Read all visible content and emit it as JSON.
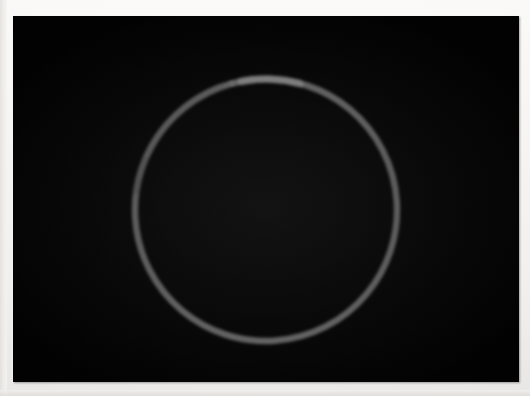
{
  "image": {
    "width": 530,
    "height": 396,
    "background_color": "#f3f1ef",
    "title": "Photograph of a thin gray ring on black background"
  },
  "photo": {
    "name": "ring-photograph",
    "frame": {
      "x": 13,
      "y": 16,
      "width": 506,
      "height": 366
    },
    "background_color": "#000000",
    "subject": "thin gray circular ring / wire loop"
  },
  "chart_data": {
    "type": "scatter",
    "subtitle": "",
    "xlabel": "",
    "ylabel": "",
    "grid": false,
    "legend": "none",
    "xlim": [
      13,
      519
    ],
    "ylim": [
      16,
      382
    ],
    "geometry": {
      "center_x": 266,
      "center_y": 210,
      "radius": 131,
      "stroke_width": 6.5,
      "stroke_color": "#9a9a9a",
      "stroke_color_bright": "#bdbdbd",
      "stroke_color_dim": "#6e6e6e",
      "background_color": "#000000"
    },
    "arc_segments": [
      {
        "name": "main-arc",
        "start_deg": 288,
        "end_deg": 648,
        "brightness": 0.72,
        "width": 6.4
      },
      {
        "name": "bright-top-arc",
        "start_deg": 259,
        "end_deg": 285,
        "brightness": 1.0,
        "width": 7.2
      },
      {
        "name": "upper-left-dash-long",
        "start_deg": 206,
        "end_deg": 250,
        "brightness": 0.66,
        "width": 6.0
      },
      {
        "name": "upper-left-dash-mid",
        "start_deg": 196,
        "end_deg": 203,
        "brightness": 0.6,
        "width": 5.6
      },
      {
        "name": "upper-left-dash-short",
        "start_deg": 188,
        "end_deg": 194,
        "brightness": 0.58,
        "width": 5.4
      },
      {
        "name": "isolated-dot",
        "start_deg": 253.5,
        "end_deg": 256.5,
        "brightness": 0.78,
        "width": 5.2
      }
    ],
    "gaps": [
      {
        "name": "gap-top-left-a",
        "start_deg": 250,
        "end_deg": 253.5
      },
      {
        "name": "gap-top-left-b",
        "start_deg": 256.5,
        "end_deg": 259
      },
      {
        "name": "gap-top-right",
        "start_deg": 285,
        "end_deg": 288
      },
      {
        "name": "gap-left-upper-a",
        "start_deg": 203,
        "end_deg": 206
      },
      {
        "name": "gap-left-upper-b",
        "start_deg": 194,
        "end_deg": 196
      },
      {
        "name": "gap-left-lower",
        "start_deg": 180,
        "end_deg": 188
      }
    ]
  }
}
